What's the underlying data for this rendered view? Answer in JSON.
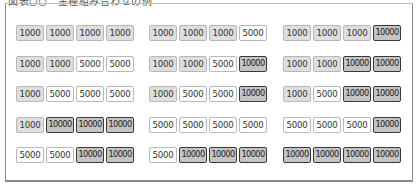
{
  "caption": "図表○○　金種組み合わせの例",
  "legend_colors": {
    "1000": "#dedede",
    "5000": "#ffffff",
    "10000": "#c4c4c4",
    "border_10000": "#3a3a3a"
  },
  "columns": [
    {
      "rows": [
        [
          "1000",
          "1000",
          "1000",
          "1000"
        ],
        [
          "1000",
          "1000",
          "5000",
          "5000"
        ],
        [
          "1000",
          "5000",
          "5000",
          "5000"
        ],
        [
          "1000",
          "10000",
          "10000",
          "10000"
        ],
        [
          "5000",
          "5000",
          "10000",
          "10000"
        ]
      ]
    },
    {
      "rows": [
        [
          "1000",
          "1000",
          "1000",
          "5000"
        ],
        [
          "1000",
          "1000",
          "5000",
          "10000"
        ],
        [
          "1000",
          "5000",
          "5000",
          "10000"
        ],
        [
          "5000",
          "5000",
          "5000",
          "5000"
        ],
        [
          "5000",
          "10000",
          "10000",
          "10000"
        ]
      ]
    },
    {
      "rows": [
        [
          "1000",
          "1000",
          "1000",
          "10000"
        ],
        [
          "1000",
          "1000",
          "10000",
          "10000"
        ],
        [
          "1000",
          "5000",
          "10000",
          "10000"
        ],
        [
          "5000",
          "5000",
          "5000",
          "10000"
        ],
        [
          "10000",
          "10000",
          "10000",
          "10000"
        ]
      ]
    }
  ]
}
